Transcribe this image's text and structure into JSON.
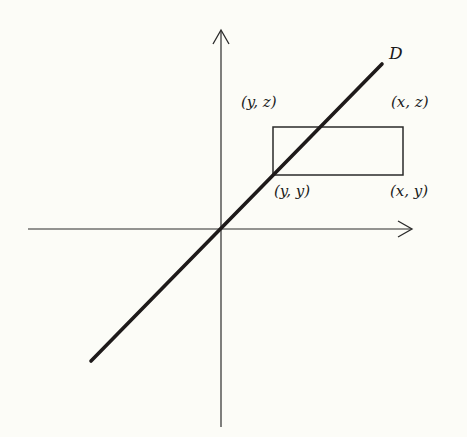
{
  "diagram": {
    "type": "geometric-figure",
    "background_color": "#fcfcf7",
    "stroke_color": "#1a1a1a",
    "axes": {
      "origin": [
        220,
        229
      ],
      "x_axis": {
        "from": [
          28,
          229
        ],
        "to": [
          412,
          229
        ],
        "arrow": true
      },
      "y_axis": {
        "from": [
          221,
          427
        ],
        "to": [
          221,
          30
        ],
        "arrow": true
      }
    },
    "line": {
      "label": "D",
      "from": [
        91,
        361
      ],
      "to": [
        382,
        64
      ],
      "stroke_width": 3.5
    },
    "rectangle": {
      "x": 273,
      "y": 127,
      "width": 130,
      "height": 48
    },
    "labels": {
      "line_label": "D",
      "top_left": "(y, z)",
      "top_right": "(x, z)",
      "bottom_left": "(y, y)",
      "bottom_right": "(x, y)"
    }
  }
}
